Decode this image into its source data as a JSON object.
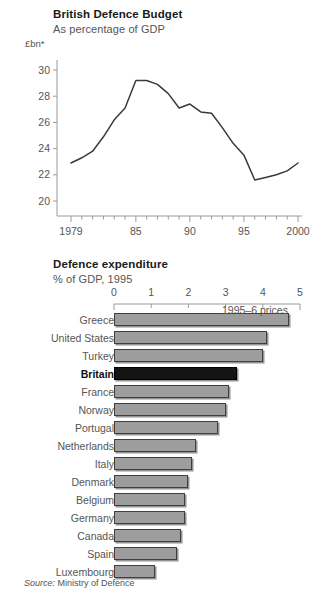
{
  "line_chart": {
    "title": "British Defence Budget",
    "subtitle": "As percentage of GDP",
    "unit_label": "£bn*"
  },
  "bar_chart": {
    "title": "Defence expenditure",
    "subtitle": "% of GDP, 1995",
    "prices_note": "1995–6 prices"
  },
  "source": {
    "prefix": "Source:",
    "text": "Ministry of Defence"
  },
  "colors": {
    "bar_fill": "#9d9d9d",
    "bar_highlight": "#141414",
    "bar_border": "#3f3f3f",
    "line": "#3a3a3a",
    "axis": "#9a9a9a",
    "text": "#555555",
    "title": "#1a1a1a"
  },
  "chart_data": [
    {
      "type": "line",
      "title": "British Defence Budget",
      "subtitle": "As percentage of GDP",
      "xlabel": "",
      "ylabel": "£bn*",
      "ylim": [
        19,
        31
      ],
      "xlim": [
        1979,
        2000
      ],
      "yticks": [
        20,
        22,
        24,
        26,
        28,
        30
      ],
      "ytick_labels": [
        "20",
        "22",
        "24",
        "26",
        "28",
        "30"
      ],
      "xticks": [
        1979,
        1985,
        1990,
        1995,
        2000
      ],
      "xtick_labels": [
        "1979",
        "85",
        "90",
        "95",
        "2000"
      ],
      "minor_xticks": true,
      "grid": false,
      "legend": null,
      "x": [
        1979,
        1980,
        1981,
        1982,
        1983,
        1984,
        1985,
        1986,
        1987,
        1988,
        1989,
        1990,
        1991,
        1992,
        1993,
        1994,
        1995,
        1996,
        1997,
        1998,
        1999,
        2000
      ],
      "values": [
        22.9,
        23.3,
        23.8,
        24.9,
        26.2,
        27.1,
        29.2,
        29.2,
        28.9,
        28.2,
        27.1,
        27.4,
        26.8,
        26.7,
        25.6,
        24.4,
        23.5,
        21.6,
        21.8,
        22.0,
        22.3,
        22.9
      ],
      "annotations": [
        "1995–6 prices"
      ]
    },
    {
      "type": "bar",
      "orientation": "horizontal",
      "title": "Defence expenditure",
      "subtitle": "% of GDP, 1995",
      "xlabel": "% of GDP",
      "ylabel": "",
      "xlim": [
        0,
        5
      ],
      "xticks": [
        0,
        1,
        2,
        3,
        4,
        5
      ],
      "xtick_labels": [
        "0",
        "1",
        "2",
        "3",
        "4",
        "5"
      ],
      "grid": false,
      "highlight_category": "Britain",
      "categories": [
        "Greece",
        "United States",
        "Turkey",
        "Britain",
        "France",
        "Norway",
        "Portugal",
        "Netherlands",
        "Italy",
        "Denmark",
        "Belgium",
        "Germany",
        "Canada",
        "Spain",
        "Luxembourg"
      ],
      "values": [
        4.7,
        4.1,
        4.0,
        3.3,
        3.1,
        3.0,
        2.8,
        2.2,
        2.1,
        2.0,
        1.9,
        1.9,
        1.8,
        1.7,
        1.1
      ],
      "annotations": [
        "1995–6 prices"
      ]
    }
  ]
}
